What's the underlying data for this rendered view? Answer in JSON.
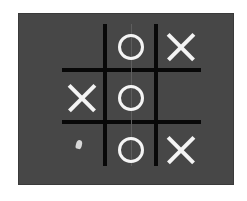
{
  "game": {
    "name": "tic-tac-toe",
    "board": [
      [
        "",
        "O",
        "X"
      ],
      [
        "X",
        "O",
        ""
      ],
      [
        "",
        "O",
        "X"
      ]
    ],
    "colors": {
      "background": "#474747",
      "grid_lines": "#080808",
      "marks": "#f4f4f4"
    }
  }
}
